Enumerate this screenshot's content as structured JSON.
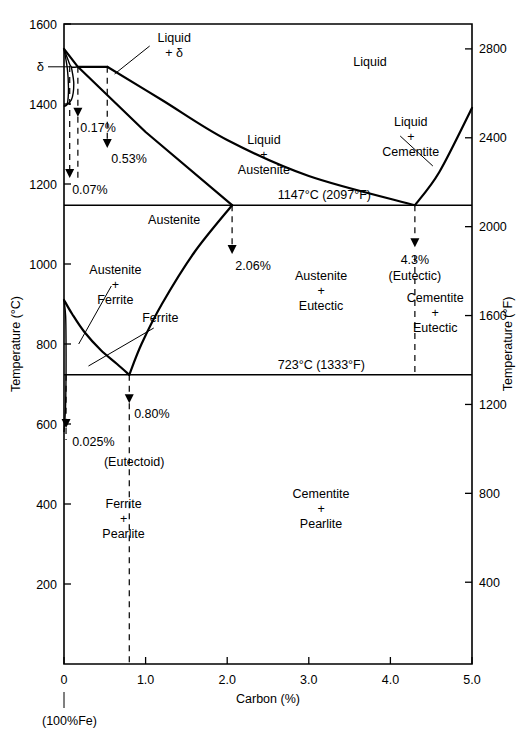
{
  "axes": {
    "x": {
      "label": "Carbon (%)",
      "origin_note": "(100%Fe)",
      "ticks": [
        "0",
        "1.0",
        "2.0",
        "3.0",
        "4.0",
        "5.0"
      ],
      "tick_values": [
        0,
        1.0,
        2.0,
        3.0,
        4.0,
        5.0
      ],
      "range": [
        0,
        5.0
      ]
    },
    "y_left": {
      "label": "Temperature (°C)",
      "ticks": [
        "1600",
        "1400",
        "1200",
        "1000",
        "800",
        "600",
        "400",
        "200"
      ],
      "tick_values": [
        1600,
        1400,
        1200,
        1000,
        800,
        600,
        400,
        200
      ],
      "range": [
        0,
        1600
      ],
      "delta_tick_label": "δ"
    },
    "y_right": {
      "label": "Temperature (°F)",
      "ticks": [
        "2800",
        "2400",
        "2000",
        "1600",
        "1200",
        "800",
        "400"
      ],
      "tick_values": [
        2800,
        2400,
        2000,
        1600,
        1200,
        800,
        400
      ],
      "range_f": [
        32,
        2912
      ]
    }
  },
  "regions": [
    {
      "name": "liquid",
      "lines": [
        "Liquid"
      ],
      "x": 3.75,
      "y": 1495
    },
    {
      "name": "liquid-plus-delta",
      "lines": [
        "Liquid",
        "+ δ"
      ],
      "x": 1.35,
      "y": 1555
    },
    {
      "name": "liquid-plus-austenite",
      "lines": [
        "Liquid",
        "+",
        "Austenite"
      ],
      "x": 2.45,
      "y": 1300
    },
    {
      "name": "liquid-plus-cementite",
      "lines": [
        "Liquid",
        "+",
        "Cementite"
      ],
      "x": 4.25,
      "y": 1345
    },
    {
      "name": "austenite",
      "lines": [
        "Austenite"
      ],
      "x": 1.35,
      "y": 1100
    },
    {
      "name": "austenite-plus-ferrite",
      "lines": [
        "Austenite",
        "+",
        "Ferrite"
      ],
      "x": 0.63,
      "y": 975
    },
    {
      "name": "ferrite",
      "lines": [
        "Ferrite"
      ],
      "x": 1.18,
      "y": 855
    },
    {
      "name": "austenite-plus-eutectic",
      "lines": [
        "Austenite",
        "+",
        "Eutectic"
      ],
      "x": 3.15,
      "y": 960
    },
    {
      "name": "cementite-plus-eutectic",
      "lines": [
        "Cementite",
        "+",
        "Eutectic"
      ],
      "x": 4.55,
      "y": 905
    },
    {
      "name": "ferrite-plus-pearlite",
      "lines": [
        "Ferrite",
        "+",
        "Pearlite"
      ],
      "x": 0.73,
      "y": 390
    },
    {
      "name": "cementite-plus-pearlite",
      "lines": [
        "Cementite",
        "+",
        "Pearlite"
      ],
      "x": 3.15,
      "y": 415
    }
  ],
  "isotherms": [
    {
      "name": "eutectic-isotherm",
      "label": "1147°C  (2097°F)",
      "temp_c": 1147,
      "label_x": 2.62,
      "x_from": 0,
      "x_to": 5.0
    },
    {
      "name": "eutectoid-isotherm",
      "label": "723°C  (1333°F)",
      "temp_c": 723,
      "label_x": 2.62,
      "x_from": 0,
      "x_to": 5.0
    }
  ],
  "callouts": [
    {
      "name": "callout-0-07",
      "label": "0.07%",
      "x": 0.07,
      "label_x": 0.1,
      "label_y": 1175,
      "arrow_top_c": 1495,
      "arrow_tip_c": 1215
    },
    {
      "name": "callout-0-17",
      "label": "0.17%",
      "x": 0.17,
      "label_x": 0.2,
      "label_y": 1330,
      "arrow_top_c": 1493,
      "arrow_tip_c": 1368
    },
    {
      "name": "callout-0-53",
      "label": "0.53%",
      "x": 0.53,
      "label_x": 0.58,
      "label_y": 1252,
      "arrow_top_c": 1493,
      "arrow_tip_c": 1290
    },
    {
      "name": "callout-2-06",
      "label": "2.06%",
      "x": 2.06,
      "label_x": 2.1,
      "label_y": 985,
      "arrow_top_c": 1147,
      "arrow_tip_c": 1025
    },
    {
      "name": "callout-4-3",
      "label": "4.3%",
      "sub_label": "(Eutectic)",
      "x": 4.3,
      "label_x": 4.3,
      "label_y": 1000,
      "arrow_top_c": 1147,
      "arrow_tip_c": 1042
    },
    {
      "name": "callout-0-025",
      "label": "0.025%",
      "sub_label": "",
      "x": 0.025,
      "label_x": 0.1,
      "label_y": 545,
      "arrow_top_c": 723,
      "arrow_tip_c": 590
    },
    {
      "name": "callout-0-80",
      "label": "0.80%",
      "sub_label": "(Eutectoid)",
      "x": 0.8,
      "label_x": 0.86,
      "label_y": 615,
      "sub_label_y": 495,
      "arrow_top_c": 723,
      "arrow_tip_c": 652
    }
  ],
  "chart_data": {
    "type": "line",
    "xlabel": "Carbon (%)",
    "ylabel": "Temperature (°C)",
    "xlim": [
      0,
      5.0
    ],
    "ylim": [
      0,
      1600
    ],
    "grid": false,
    "legend": "none",
    "invariant_points": [
      {
        "name": "peritectic",
        "carbon": 0.17,
        "temp_c": 1493
      },
      {
        "name": "delta-max-solubility",
        "carbon": 0.07,
        "temp_c": 1493
      },
      {
        "name": "peritectic-liquid",
        "carbon": 0.53,
        "temp_c": 1493
      },
      {
        "name": "max-austenite-solubility",
        "carbon": 2.06,
        "temp_c": 1147
      },
      {
        "name": "eutectic",
        "carbon": 4.3,
        "temp_c": 1147
      },
      {
        "name": "eutectoid",
        "carbon": 0.8,
        "temp_c": 723
      },
      {
        "name": "max-ferrite-solubility",
        "carbon": 0.025,
        "temp_c": 723
      },
      {
        "name": "pure-iron-melting",
        "carbon": 0.0,
        "temp_c": 1538
      }
    ],
    "series": [
      {
        "name": "liquidus-delta",
        "points": [
          [
            0.0,
            1538
          ],
          [
            0.17,
            1493
          ],
          [
            0.53,
            1493
          ]
        ]
      },
      {
        "name": "liquidus-austenite",
        "points": [
          [
            0.53,
            1493
          ],
          [
            1.2,
            1410
          ],
          [
            2.0,
            1310
          ],
          [
            3.0,
            1220
          ],
          [
            4.3,
            1147
          ]
        ]
      },
      {
        "name": "liquidus-cementite",
        "points": [
          [
            4.3,
            1147
          ],
          [
            4.6,
            1230
          ],
          [
            5.0,
            1390
          ]
        ]
      },
      {
        "name": "delta-solidus",
        "points": [
          [
            0.0,
            1538
          ],
          [
            0.05,
            1510
          ],
          [
            0.09,
            1493
          ],
          [
            0.17,
            1493
          ]
        ]
      },
      {
        "name": "delta-solvus",
        "points": [
          [
            0.0,
            1538
          ],
          [
            0.04,
            1490
          ],
          [
            0.055,
            1440
          ],
          [
            0.04,
            1400
          ],
          [
            0.0,
            1394
          ]
        ]
      },
      {
        "name": "austenite-solidus",
        "points": [
          [
            0.17,
            1493
          ],
          [
            1.0,
            1330
          ],
          [
            2.06,
            1147
          ]
        ]
      },
      {
        "name": "austenite-delta-boundary",
        "points": [
          [
            0.09,
            1493
          ],
          [
            0.12,
            1450
          ],
          [
            0.09,
            1410
          ],
          [
            0.0,
            1394
          ]
        ]
      },
      {
        "name": "acm-cementite-solvus",
        "points": [
          [
            2.06,
            1147
          ],
          [
            1.6,
            1030
          ],
          [
            1.2,
            900
          ],
          [
            0.95,
            800
          ],
          [
            0.8,
            723
          ]
        ]
      },
      {
        "name": "a3-austenite-ferrite",
        "points": [
          [
            0.0,
            910
          ],
          [
            0.1,
            875
          ],
          [
            0.25,
            830
          ],
          [
            0.45,
            785
          ],
          [
            0.65,
            750
          ],
          [
            0.8,
            723
          ]
        ]
      },
      {
        "name": "alpha-ferrite-solvus",
        "points": [
          [
            0.0,
            910
          ],
          [
            0.02,
            870
          ],
          [
            0.025,
            800
          ],
          [
            0.025,
            723
          ]
        ]
      },
      {
        "name": "ferrite-solvus-low",
        "points": [
          [
            0.025,
            723
          ],
          [
            0.02,
            650
          ],
          [
            0.008,
            600
          ],
          [
            0.0,
            580
          ]
        ]
      },
      {
        "name": "eutectic-isotherm",
        "points": [
          [
            0.0,
            1147
          ],
          [
            5.0,
            1147
          ]
        ]
      },
      {
        "name": "eutectoid-isotherm",
        "points": [
          [
            0.0,
            723
          ],
          [
            5.0,
            723
          ]
        ]
      }
    ]
  }
}
